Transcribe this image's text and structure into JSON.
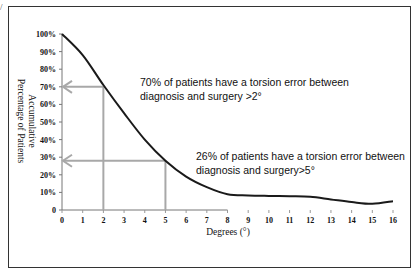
{
  "chart_data": {
    "type": "line",
    "title": "",
    "xlabel": "Degrees (°)",
    "ylabel_lines": [
      "Accumulative",
      "Percentage of Patients"
    ],
    "xlim": [
      0,
      16
    ],
    "ylim": [
      0,
      100
    ],
    "x_ticks": [
      "0",
      "1",
      "2",
      "3",
      "4",
      "5",
      "6",
      "7",
      "8",
      "9",
      "10",
      "11",
      "12",
      "13",
      "14",
      "15",
      "16"
    ],
    "y_ticks": [
      "0",
      "10%",
      "20%",
      "30%",
      "40%",
      "50%",
      "60%",
      "70%",
      "80%",
      "90%",
      "100%"
    ],
    "grid": false,
    "legend": null,
    "series": [
      {
        "name": "Accumulative percentage of patients",
        "x": [
          0,
          1,
          2,
          3,
          4,
          5,
          6,
          7,
          8,
          9,
          10,
          11,
          12,
          13,
          14,
          15,
          16
        ],
        "values": [
          100,
          88,
          71,
          55,
          40,
          28,
          19,
          13,
          9,
          8.3,
          8,
          7.8,
          7.5,
          6,
          4.5,
          3.5,
          5
        ]
      }
    ],
    "reference_lines": [
      {
        "x": 2,
        "y": 70,
        "style": "gray arrow to y-axis"
      },
      {
        "x": 5,
        "y": 28,
        "style": "gray arrow to y-axis"
      }
    ],
    "annotations": [
      {
        "lines": [
          "70% of patients have a torsion error between",
          "diagnosis and surgery >2°"
        ]
      },
      {
        "lines": [
          "26% of patients have a torsion error between",
          "diagnosis and surgery>5°"
        ]
      }
    ]
  },
  "corner_mark": "/"
}
